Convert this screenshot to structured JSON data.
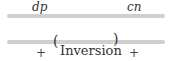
{
  "top": {
    "label_left": "dp",
    "label_right": "cn"
  },
  "bottom": {
    "paren_open": "(",
    "paren_close": ")",
    "sign_left": "+",
    "center_label": "Inversion",
    "sign_right": "+"
  },
  "colors": {
    "chromosome": "#cfcfcf",
    "text": "#333333"
  }
}
